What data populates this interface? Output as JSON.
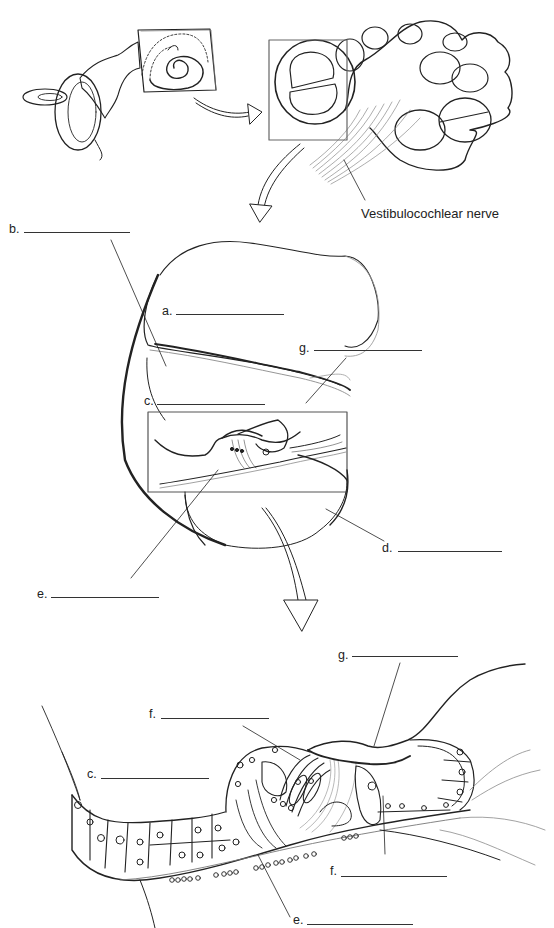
{
  "figure": {
    "type": "anatomy-labeling-worksheet",
    "panels": [
      {
        "name": "inner-ear-overview",
        "description": "Bony labyrinth with cochlea boxed"
      },
      {
        "name": "cochlea-cross-section",
        "description": "Cochlear turns with box over one turn"
      },
      {
        "name": "cochlear-duct-section",
        "description": "Enlarged cross-section of one cochlear turn"
      },
      {
        "name": "organ-of-corti-detail",
        "description": "Enlarged spiral organ on basilar membrane"
      }
    ]
  },
  "captions": {
    "nerve": "Vestibulocochlear nerve"
  },
  "labels": {
    "a": "a.",
    "b": "b.",
    "c": "c.",
    "d": "d.",
    "e": "e.",
    "g": "g.",
    "c2": "c.",
    "e2": "e.",
    "f1": "f.",
    "f2": "f.",
    "g2": "g."
  },
  "answers": {
    "a": "",
    "b": "",
    "c": "",
    "d": "",
    "e": "",
    "f": "",
    "g": ""
  },
  "colors": {
    "ink": "#222222",
    "light_ink": "#9a9a9a",
    "background": "#ffffff"
  }
}
